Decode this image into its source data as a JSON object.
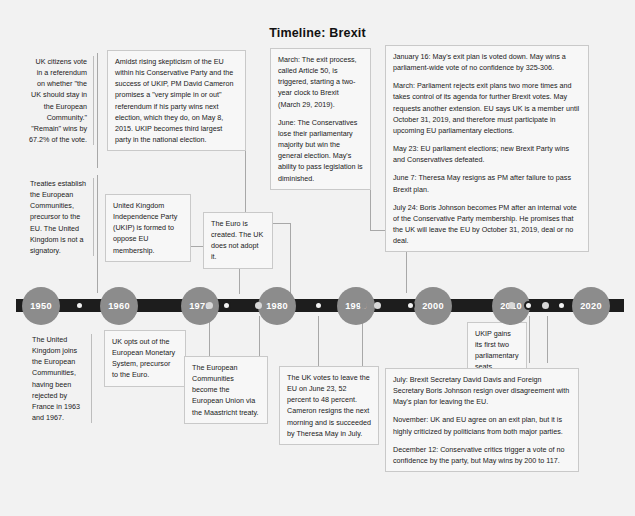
{
  "title": "Timeline: Brexit",
  "axis": {
    "years": [
      "1950",
      "1960",
      "1970",
      "1980",
      "1990",
      "2000",
      "2010",
      "2020"
    ]
  },
  "events_above": {
    "referendum_1975": "UK citizens vote in a referendum on whether \"the UK should stay in the European Community.\" \"Remain\" wins by 67.2% of the vote.",
    "treaties_1950s": "Treaties establish the European Communities, precursor to the EU. The United Kingdom is not a signatory.",
    "ukip_formed": "United Kingdom Independence Party (UKIP) is formed to oppose EU membership.",
    "euro_created": "The Euro is created. The UK does not adopt it.",
    "cameron_promise": "Amidst rising skepticism of the EU within his Conservative Party and the success of UKIP, PM David Cameron promises a \"very simple in or out\" referendum if his party wins next election, which they do, on May 8, 2015. UKIP becomes third largest party in the national election.",
    "y2017_march": "March: The exit process, called Article 50, is triggered, starting a two-year clock to Brexit (March 29, 2019).",
    "y2017_june": "June: The Conservatives lose their parliamentary majority but win the general election. May's ability to pass legislation is diminished.",
    "y2019_january": "January 16: May's exit plan is voted down. May wins a parliament-wide vote of no confidence by 325-306.",
    "y2019_march": "March: Parliament rejects exit plans two more times and takes control of its agenda for further Brexit votes. May requests another extension. EU says UK is a member until October 31, 2019, and therefore must participate in upcoming EU parliamentary elections.",
    "y2019_may": "May 23: EU parliament elections; new Brexit Party wins and Conservatives defeated.",
    "y2019_june": "June 7: Theresa May resigns as PM after failure to pass Brexit plan.",
    "y2019_july": "July 24: Boris Johnson becomes PM after an internal vote of the Conservative Party membership. He promises that the UK will leave the EU by October 31, 2019, deal or no deal."
  },
  "events_below": {
    "uk_joins": "The United Kingdom joins the European Communities, having been rejected by France in 1963 and 1967.",
    "ems_optout": "UK opts out of the European Monetary System, precursor to the Euro.",
    "maastricht": "The European Communities become the European Union via the Maastricht treaty.",
    "ukip_seats": "UKIP gains its first two parliamentary seats",
    "brexit_vote": "The UK votes to leave the EU on June 23, 52 percent to 48 percent. Cameron resigns the next morning and is succeeded by Theresa May in July.",
    "y2018_july": "July: Brexit Secretary David Davis and Foreign Secretary Boris Johnson resign over disagreement with May's plan for leaving the EU.",
    "y2018_november": "November: UK and EU agree on an exit plan, but it is highly criticized by politicians from both major parties.",
    "y2018_december": "December 12: Conservative critics trigger a vote of no confidence by the party, but May wins by 200 to 117."
  },
  "colors": {
    "page_background": "#f2f2f2",
    "axis_bar": "#1d1d1d",
    "node_fill": "#8c8c8c",
    "node_text": "#ffffff",
    "connector": "#a8a8a8",
    "box_border": "#c9c9c9",
    "text": "#1a1a1a"
  }
}
